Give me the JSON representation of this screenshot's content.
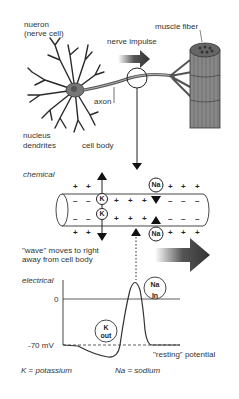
{
  "diagram": {
    "top": {
      "neuron_label_1": "nueron",
      "neuron_label_2": "(nerve cell)",
      "nerve_impulse": "nerve impulse",
      "muscle_fiber": "muscle fiber",
      "axon": "axon",
      "nucleus": "nucleus",
      "dendrites": "dendrites",
      "cell_body": "cell body"
    },
    "chemical": {
      "title": "chemical",
      "k_label": "K",
      "na_label": "Na",
      "wave_text_1": "\"wave\" moves to  right",
      "wave_text_2": "away from cell body"
    },
    "electrical": {
      "title": "electrical",
      "zero": "0",
      "minus70": "-70 mV",
      "na_in_1": "Na",
      "na_in_2": "In",
      "k_out_1": "K",
      "k_out_2": "out",
      "resting": "\"resting\" potential"
    },
    "legend": {
      "k": "K = potassium",
      "na": "Na = sodium"
    }
  }
}
